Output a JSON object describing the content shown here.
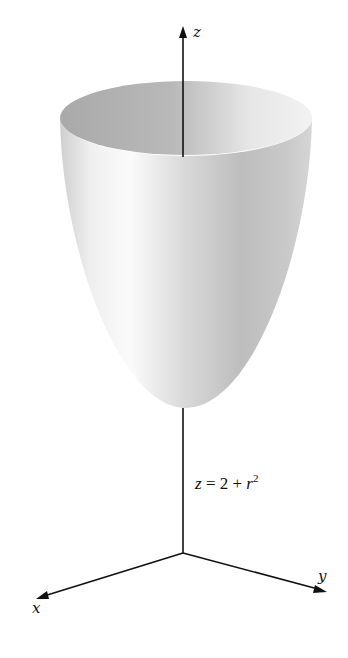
{
  "figure": {
    "equation": {
      "lhs": "z",
      "op": " = 2 + ",
      "var": "r",
      "exp": "2",
      "full": "z = 2 + r^2"
    },
    "axes": {
      "x_label": "x",
      "y_label": "y",
      "z_label": "z"
    },
    "surface": {
      "type": "paraboloid",
      "description": "circular paraboloid opening upward, vertex on z-axis at z = 2"
    },
    "colors": {
      "axis": "#111111",
      "surface_light": "#f7f7f7",
      "surface_mid": "#c8c8c8",
      "surface_dark": "#a8a8a8",
      "rim_inner": "#b0b0b0"
    }
  }
}
